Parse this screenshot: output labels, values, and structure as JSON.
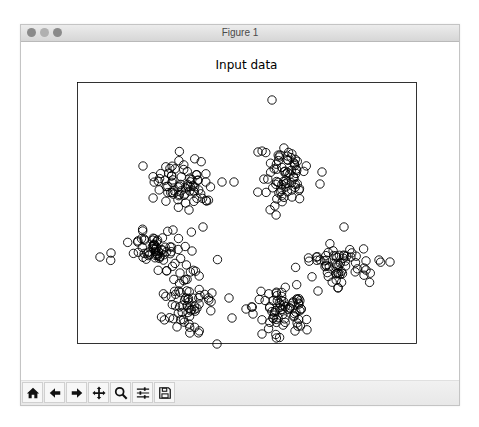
{
  "window": {
    "title": "Figure 1",
    "traffic_lights": [
      "close",
      "minimize",
      "maximize"
    ]
  },
  "toolbar": {
    "buttons": [
      {
        "name": "home",
        "icon": "home-icon",
        "tooltip": "Reset original view"
      },
      {
        "name": "back",
        "icon": "arrow-left-icon",
        "tooltip": "Back to previous view"
      },
      {
        "name": "forward",
        "icon": "arrow-right-icon",
        "tooltip": "Forward to next view"
      },
      {
        "name": "pan",
        "icon": "move-icon",
        "tooltip": "Pan axes"
      },
      {
        "name": "zoom",
        "icon": "magnifier-icon",
        "tooltip": "Zoom to rectangle"
      },
      {
        "name": "subplots",
        "icon": "sliders-icon",
        "tooltip": "Configure subplots"
      },
      {
        "name": "save",
        "icon": "floppy-disk-icon",
        "tooltip": "Save the figure"
      }
    ]
  },
  "colors": {
    "marker_edge": "#000000",
    "marker_face": "none",
    "axes_frame": "#000000",
    "titlebar_text": "#4a4a4a"
  },
  "chart_data": {
    "type": "scatter",
    "title": "Input data",
    "xlabel": "",
    "ylabel": "",
    "ticks_visible": false,
    "grid": false,
    "legend": null,
    "marker": "hollow circle",
    "coordinate_space": "pixel (plot frame 56..395 x, 40..301 y inside canvas)",
    "clusters": [
      {
        "name": "upper-left",
        "cx": 163,
        "cy": 141,
        "sx": 15,
        "sy": 12,
        "n": 70,
        "outliers": [
          [
            122,
            124
          ],
          [
            201,
            140
          ],
          [
            213,
            140
          ],
          [
            168,
            168
          ],
          [
            182,
            185
          ],
          [
            164,
            152
          ]
        ]
      },
      {
        "name": "upper-right",
        "cx": 262,
        "cy": 133,
        "sx": 11,
        "sy": 16,
        "n": 70,
        "outliers": [
          [
            251,
            58
          ],
          [
            237,
            110
          ],
          [
            271,
            155
          ],
          [
            301,
            130
          ],
          [
            299,
            142
          ]
        ]
      },
      {
        "name": "left",
        "cx": 135,
        "cy": 208,
        "sx": 13,
        "sy": 9,
        "n": 60,
        "outliers": [
          [
            79,
            215
          ],
          [
            90,
            211
          ],
          [
            152,
            188
          ],
          [
            159,
            231
          ],
          [
            171,
            209
          ]
        ]
      },
      {
        "name": "right",
        "cx": 318,
        "cy": 223,
        "sx": 15,
        "sy": 10,
        "n": 60,
        "outliers": [
          [
            358,
            218
          ],
          [
            369,
            220
          ],
          [
            323,
            185
          ],
          [
            317,
            246
          ],
          [
            345,
            228
          ]
        ]
      },
      {
        "name": "lower-left",
        "cx": 165,
        "cy": 256,
        "sx": 14,
        "sy": 15,
        "n": 70,
        "outliers": [
          [
            211,
            276
          ],
          [
            196,
            302
          ],
          [
            208,
            256
          ],
          [
            168,
            282
          ]
        ]
      },
      {
        "name": "lower-right",
        "cx": 262,
        "cy": 266,
        "sx": 15,
        "sy": 14,
        "n": 70,
        "outliers": [
          [
            225,
            267
          ],
          [
            232,
            272
          ],
          [
            241,
            292
          ],
          [
            274,
            289
          ],
          [
            297,
            249
          ]
        ]
      }
    ],
    "approx_total_points": 420
  }
}
